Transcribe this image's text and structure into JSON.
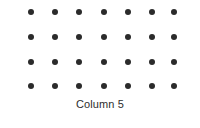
{
  "figure": {
    "background_color": "#ffffff",
    "width": 200,
    "height": 128
  },
  "xlabel": {
    "text": "Column 5",
    "color": "#2e2e2e",
    "font_size_px": 11,
    "center_x": 100,
    "top_y": 98
  },
  "marker": {
    "color": "#2b2b2b",
    "shape": "circle",
    "diameter_px": 6
  },
  "chart_data": {
    "type": "scatter",
    "title": "",
    "xlabel": "Column 5",
    "ylabel": "",
    "grid": false,
    "legend": null,
    "marker_color": "#2b2b2b",
    "marker_size_px": 6,
    "columns": 7,
    "rows": 4,
    "x_pixels": [
      31,
      55,
      79,
      104,
      128,
      152,
      174
    ],
    "y_pixels": [
      12,
      37,
      62,
      86
    ],
    "x": [
      1,
      2,
      3,
      4,
      5,
      6,
      7,
      1,
      2,
      3,
      4,
      5,
      6,
      7,
      1,
      2,
      3,
      4,
      5,
      6,
      7,
      1,
      2,
      3,
      4,
      5,
      6,
      7
    ],
    "y": [
      4,
      4,
      4,
      4,
      4,
      4,
      4,
      3,
      3,
      3,
      3,
      3,
      3,
      3,
      2,
      2,
      2,
      2,
      2,
      2,
      2,
      1,
      1,
      1,
      1,
      1,
      1,
      1
    ],
    "points": [
      {
        "x": 1,
        "y": 4,
        "px": 31,
        "py": 12
      },
      {
        "x": 2,
        "y": 4,
        "px": 55,
        "py": 12
      },
      {
        "x": 3,
        "y": 4,
        "px": 79,
        "py": 12
      },
      {
        "x": 4,
        "y": 4,
        "px": 104,
        "py": 12
      },
      {
        "x": 5,
        "y": 4,
        "px": 128,
        "py": 12
      },
      {
        "x": 6,
        "y": 4,
        "px": 152,
        "py": 12
      },
      {
        "x": 7,
        "y": 4,
        "px": 174,
        "py": 12
      },
      {
        "x": 1,
        "y": 3,
        "px": 31,
        "py": 37
      },
      {
        "x": 2,
        "y": 3,
        "px": 55,
        "py": 37
      },
      {
        "x": 3,
        "y": 3,
        "px": 79,
        "py": 37
      },
      {
        "x": 4,
        "y": 3,
        "px": 104,
        "py": 37
      },
      {
        "x": 5,
        "y": 3,
        "px": 128,
        "py": 37
      },
      {
        "x": 6,
        "y": 3,
        "px": 152,
        "py": 37
      },
      {
        "x": 7,
        "y": 3,
        "px": 174,
        "py": 37
      },
      {
        "x": 1,
        "y": 2,
        "px": 31,
        "py": 62
      },
      {
        "x": 2,
        "y": 2,
        "px": 55,
        "py": 62
      },
      {
        "x": 3,
        "y": 2,
        "px": 79,
        "py": 62
      },
      {
        "x": 4,
        "y": 2,
        "px": 104,
        "py": 62
      },
      {
        "x": 5,
        "y": 2,
        "px": 128,
        "py": 62
      },
      {
        "x": 6,
        "y": 2,
        "px": 152,
        "py": 62
      },
      {
        "x": 7,
        "y": 2,
        "px": 174,
        "py": 62
      },
      {
        "x": 1,
        "y": 1,
        "px": 31,
        "py": 86
      },
      {
        "x": 2,
        "y": 1,
        "px": 55,
        "py": 86
      },
      {
        "x": 3,
        "y": 1,
        "px": 79,
        "py": 86
      },
      {
        "x": 4,
        "y": 1,
        "px": 104,
        "py": 86
      },
      {
        "x": 5,
        "y": 1,
        "px": 128,
        "py": 86
      },
      {
        "x": 6,
        "y": 1,
        "px": 152,
        "py": 86
      },
      {
        "x": 7,
        "y": 1,
        "px": 174,
        "py": 86
      }
    ]
  }
}
